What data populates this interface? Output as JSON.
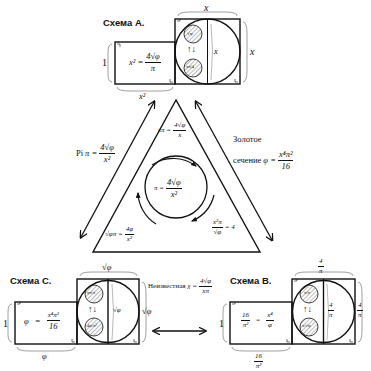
{
  "schemes": {
    "A": {
      "title": "Схема А.",
      "rect_height": "1",
      "rect_width": "x²",
      "rect_formula_lhs": "x² =",
      "rect_formula_num": "4√φ",
      "rect_formula_den": "π",
      "square_top": "x",
      "square_side": "x",
      "inner_diameter": "x",
      "small_circle_top": "√φ",
      "small_circle_bottom": "xπ/4",
      "swap_arrows": "↑↓"
    },
    "B": {
      "title": "Схема В.",
      "rect_height": "1",
      "rect_width_num": "16",
      "rect_width_den": "π²",
      "rect_lhs_num": "16",
      "rect_lhs_den": "π²",
      "rect_eq": "=",
      "rect_rhs_num": "x⁴",
      "rect_rhs_den": "φ",
      "square_top_num": "4",
      "square_top_den": "π",
      "square_side_num": "4",
      "square_side_den": "π",
      "inner_diameter_num": "4",
      "inner_diameter_den": "π",
      "small_circle_top": "x/π",
      "small_circle_bottom": "x/√φ",
      "swap_arrows": "↑↓"
    },
    "C": {
      "title": "Схема С.",
      "rect_height": "1",
      "rect_width": "φ",
      "rect_lhs": "φ",
      "rect_eq": "=",
      "rect_rhs_num": "x⁴π²",
      "rect_rhs_den": "16",
      "square_top": "√φ",
      "square_side": "√φ",
      "inner_diameter": "√φ",
      "small_circle_top": "φπ/x",
      "small_circle_bottom": "4φ/x²",
      "swap_arrows": "↑↓"
    }
  },
  "triangle": {
    "left_label_prefix": "Pi",
    "left_label_lhs": "π =",
    "left_label_num": "4√φ",
    "left_label_den": "x²",
    "right_label_line1": "Золотое",
    "right_label_line2": "сечение",
    "right_label_lhs": "φ =",
    "right_label_num": "x⁴π²",
    "right_label_den": "16",
    "bottom_label_prefix": "Неизвестная",
    "bottom_label_lhs": "χ =",
    "bottom_label_num": "4√φ",
    "bottom_label_den": "xπ",
    "inner_top_lhs": "xπ =",
    "inner_top_num": "4√φ",
    "inner_top_den": "x",
    "center_lhs": "π =",
    "center_num": "4√φ",
    "center_den": "x²",
    "inner_left_lhs": "√φπ =",
    "inner_left_num": "4φ",
    "inner_left_den": "x²",
    "inner_right_num": "x²π",
    "inner_right_den": "√φ",
    "inner_right_rhs": "= 4"
  },
  "colors": {
    "stroke": "#111111",
    "background": "#ffffff",
    "hatch": "#555555"
  }
}
